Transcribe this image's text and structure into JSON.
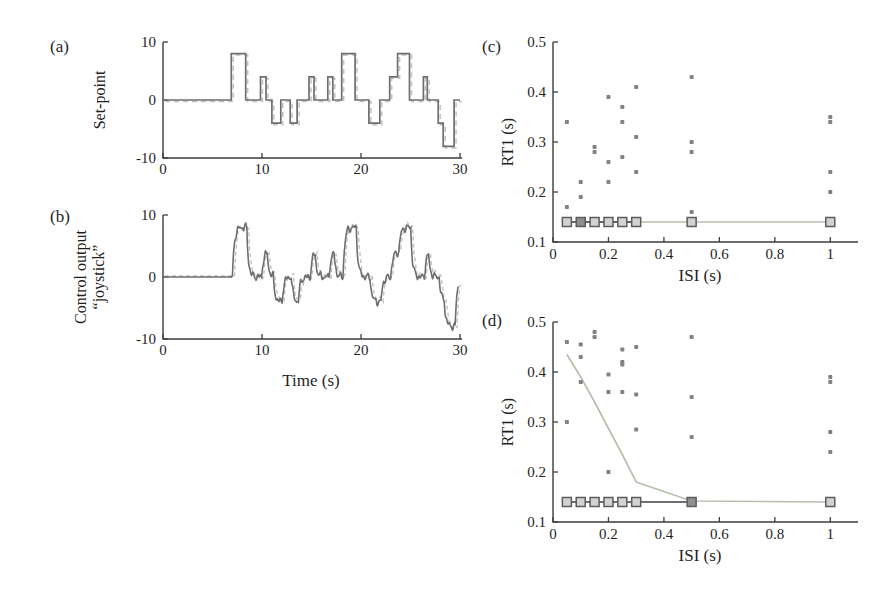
{
  "figure": {
    "type": "scientific-figure",
    "background": "#ffffff"
  },
  "colors": {
    "axis": "#3d3d3d",
    "tick_text": "#1f1f1f",
    "trace_dark": "#6e6e6e",
    "trace_light": "#bcc6bc",
    "dot": "#828282",
    "square_fill": "#d2d2d2",
    "square_fill_dark": "#8f8f8f",
    "square_stroke": "#5c5c5c",
    "line_light": "#b5c0ae",
    "line_dark": "#3f3f3f"
  },
  "panels": {
    "a": {
      "label": "(a)",
      "ylabel": "Set-point"
    },
    "b": {
      "label": "(b)",
      "ylabel_line1": "Control output",
      "ylabel_line2": "“joystick”",
      "xlabel": "Time (s)"
    },
    "c": {
      "label": "(c)",
      "ylabel": "RT1 (s)",
      "xlabel": "ISI (s)"
    },
    "d": {
      "label": "(d)",
      "ylabel": "RT1 (s)",
      "xlabel": "ISI (s)"
    }
  },
  "chart_data": [
    {
      "id": "a",
      "type": "line",
      "subtype": "step",
      "title": "",
      "xlabel": "",
      "ylabel": "Set-point",
      "xlim": [
        0,
        30
      ],
      "ylim": [
        -10,
        10
      ],
      "xticks": [
        0,
        10,
        20,
        30
      ],
      "yticks": [
        -10,
        0,
        10
      ],
      "grid": false,
      "steps": [
        [
          0,
          0
        ],
        [
          6.9,
          8
        ],
        [
          8.35,
          0
        ],
        [
          9.85,
          4
        ],
        [
          10.4,
          0
        ],
        [
          11.0,
          -4
        ],
        [
          11.9,
          0
        ],
        [
          12.85,
          -4
        ],
        [
          13.55,
          0
        ],
        [
          14.75,
          4
        ],
        [
          15.25,
          0
        ],
        [
          16.65,
          4
        ],
        [
          17.15,
          0
        ],
        [
          18.05,
          8
        ],
        [
          19.4,
          0
        ],
        [
          20.8,
          -4
        ],
        [
          21.9,
          0
        ],
        [
          22.9,
          4
        ],
        [
          23.7,
          8
        ],
        [
          24.9,
          0
        ],
        [
          26.3,
          4
        ],
        [
          26.7,
          0
        ],
        [
          27.8,
          -4
        ],
        [
          28.3,
          -8
        ],
        [
          29.4,
          0
        ]
      ]
    },
    {
      "id": "b",
      "type": "line",
      "subtype": "smoothed-step",
      "title": "",
      "xlabel": "Time (s)",
      "ylabel": "Control output “joystick”",
      "xlim": [
        0,
        30
      ],
      "ylim": [
        -10,
        10
      ],
      "xticks": [
        0,
        10,
        20,
        30
      ],
      "yticks": [
        -10,
        0,
        10
      ],
      "grid": false,
      "steps": [
        [
          0,
          0
        ],
        [
          6.9,
          8
        ],
        [
          8.35,
          0
        ],
        [
          9.85,
          4
        ],
        [
          10.4,
          0
        ],
        [
          11.0,
          -4
        ],
        [
          11.9,
          0
        ],
        [
          12.85,
          -4
        ],
        [
          13.55,
          0
        ],
        [
          14.75,
          4
        ],
        [
          15.25,
          0
        ],
        [
          16.65,
          4
        ],
        [
          17.15,
          0
        ],
        [
          18.05,
          8
        ],
        [
          19.4,
          0
        ],
        [
          20.8,
          -4
        ],
        [
          21.9,
          0
        ],
        [
          22.9,
          4
        ],
        [
          23.7,
          8
        ],
        [
          24.9,
          0
        ],
        [
          26.3,
          4
        ],
        [
          26.7,
          0
        ],
        [
          27.8,
          -4
        ],
        [
          28.3,
          -8
        ],
        [
          29.4,
          0
        ]
      ]
    },
    {
      "id": "c",
      "type": "scatter",
      "title": "",
      "xlabel": "ISI (s)",
      "ylabel": "RT1 (s)",
      "xlim": [
        0,
        1.1
      ],
      "ylim": [
        0.1,
        0.5
      ],
      "xticks": [
        0,
        0.2,
        0.4,
        0.6,
        0.8,
        1
      ],
      "yticks": [
        0.1,
        0.2,
        0.3,
        0.4,
        0.5
      ],
      "grid": false,
      "dots": [
        [
          0.05,
          0.34
        ],
        [
          0.05,
          0.17
        ],
        [
          0.1,
          0.22
        ],
        [
          0.1,
          0.19
        ],
        [
          0.15,
          0.29
        ],
        [
          0.15,
          0.28
        ],
        [
          0.2,
          0.39
        ],
        [
          0.2,
          0.26
        ],
        [
          0.2,
          0.22
        ],
        [
          0.25,
          0.37
        ],
        [
          0.25,
          0.34
        ],
        [
          0.25,
          0.27
        ],
        [
          0.3,
          0.41
        ],
        [
          0.3,
          0.31
        ],
        [
          0.3,
          0.24
        ],
        [
          0.5,
          0.43
        ],
        [
          0.5,
          0.3
        ],
        [
          0.5,
          0.28
        ],
        [
          0.5,
          0.16
        ],
        [
          1,
          0.35
        ],
        [
          1,
          0.34
        ],
        [
          1,
          0.24
        ],
        [
          1,
          0.2
        ]
      ],
      "squares_x": [
        0.05,
        0.1,
        0.15,
        0.2,
        0.25,
        0.3,
        0.5,
        1
      ],
      "squares_y": 0.14,
      "squares_dark_x": [
        0.1
      ],
      "line_light": [
        [
          0.05,
          0.14
        ],
        [
          1,
          0.14
        ]
      ],
      "line_dark": [
        [
          0.05,
          0.14
        ],
        [
          0.3,
          0.14
        ]
      ]
    },
    {
      "id": "d",
      "type": "scatter",
      "title": "",
      "xlabel": "ISI (s)",
      "ylabel": "RT1 (s)",
      "xlim": [
        0,
        1.1
      ],
      "ylim": [
        0.1,
        0.5
      ],
      "xticks": [
        0,
        0.2,
        0.4,
        0.6,
        0.8,
        1
      ],
      "yticks": [
        0.1,
        0.2,
        0.3,
        0.4,
        0.5
      ],
      "grid": false,
      "dots": [
        [
          0.05,
          0.46
        ],
        [
          0.05,
          0.3
        ],
        [
          0.1,
          0.455
        ],
        [
          0.1,
          0.43
        ],
        [
          0.1,
          0.38
        ],
        [
          0.15,
          0.48
        ],
        [
          0.15,
          0.47
        ],
        [
          0.2,
          0.395
        ],
        [
          0.2,
          0.36
        ],
        [
          0.2,
          0.2
        ],
        [
          0.25,
          0.445
        ],
        [
          0.25,
          0.42
        ],
        [
          0.25,
          0.415
        ],
        [
          0.25,
          0.36
        ],
        [
          0.3,
          0.45
        ],
        [
          0.3,
          0.355
        ],
        [
          0.3,
          0.285
        ],
        [
          0.5,
          0.47
        ],
        [
          0.5,
          0.35
        ],
        [
          0.5,
          0.27
        ],
        [
          1,
          0.39
        ],
        [
          1,
          0.38
        ],
        [
          1,
          0.28
        ],
        [
          1,
          0.24
        ]
      ],
      "squares_x": [
        0.05,
        0.1,
        0.15,
        0.2,
        0.25,
        0.3,
        0.5,
        1
      ],
      "squares_y": 0.14,
      "squares_dark_x": [
        0.5
      ],
      "line_light": [
        [
          0.05,
          0.435
        ],
        [
          0.1,
          0.39
        ],
        [
          0.15,
          0.34
        ],
        [
          0.2,
          0.287
        ],
        [
          0.25,
          0.235
        ],
        [
          0.3,
          0.18
        ],
        [
          0.5,
          0.142
        ],
        [
          1,
          0.14
        ]
      ],
      "line_dark": [
        [
          0.05,
          0.14
        ],
        [
          0.5,
          0.14
        ]
      ]
    }
  ]
}
